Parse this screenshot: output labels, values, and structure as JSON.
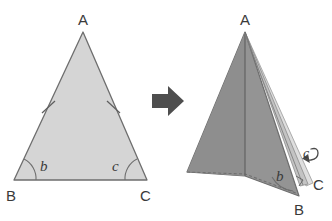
{
  "figure": {
    "canvas": {
      "width": 332,
      "height": 221,
      "background": "#ffffff"
    }
  },
  "colors": {
    "unfolded_fill": "#d5d5d5",
    "folded_fill": "#949494",
    "flap_fill": "#c9c9c9",
    "flap_fill_light": "#dedede",
    "outline": "#6e6e6e",
    "crease": "#5e5e5e",
    "arrow": "#4e4e4e",
    "label_text": "#3a3a3a"
  },
  "left_figure": {
    "name": "unfolded-isosceles-triangle",
    "vertices": {
      "A": {
        "x": 83,
        "y": 32,
        "label": "A"
      },
      "B": {
        "x": 14,
        "y": 180,
        "label": "B"
      },
      "C": {
        "x": 147,
        "y": 180,
        "label": "C"
      }
    },
    "vertex_labels": [
      {
        "text": "A",
        "x": 78,
        "y": 25
      },
      {
        "text": "B",
        "x": 6,
        "y": 201
      },
      {
        "text": "C",
        "x": 140,
        "y": 201
      }
    ],
    "angle_labels": [
      {
        "text": "b",
        "x": 40,
        "y": 171,
        "vertex": "B"
      },
      {
        "text": "c",
        "x": 114,
        "y": 171,
        "vertex": "C"
      }
    ],
    "congruence_ticks": 2,
    "tick_sides": [
      "AB",
      "AC"
    ]
  },
  "arrow": {
    "name": "transformation-arrow",
    "direction": "right",
    "x": 152,
    "y": 86,
    "width": 32,
    "height": 30
  },
  "right_figure": {
    "name": "folded-triangle",
    "vertices": {
      "A": {
        "x": 245,
        "y": 32,
        "label": "A"
      },
      "B": {
        "x": 299,
        "y": 196,
        "label": "B"
      },
      "C": {
        "x": 310,
        "y": 181,
        "label": "C"
      }
    },
    "vertex_labels": [
      {
        "text": "A",
        "x": 240,
        "y": 25
      },
      {
        "text": "B",
        "x": 294,
        "y": 215
      },
      {
        "text": "C",
        "x": 313,
        "y": 189
      }
    ],
    "angle_labels": [
      {
        "text": "b",
        "x": 278,
        "y": 180,
        "vertex": "B"
      },
      {
        "text": "c",
        "x": 305,
        "y": 160,
        "vertex": "C"
      }
    ],
    "has_crease_line": true,
    "has_dashed_base": true,
    "has_curl_arrow": true
  }
}
